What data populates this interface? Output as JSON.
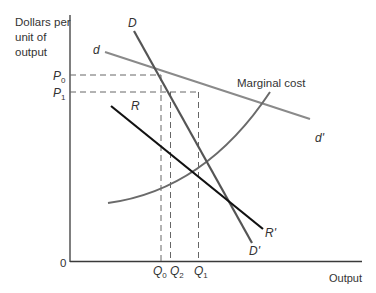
{
  "axes": {
    "y_label_lines": [
      "Dollars per",
      "unit of",
      "output"
    ],
    "x_label": "Output",
    "origin": "0"
  },
  "price_ticks": [
    {
      "name": "P",
      "sub": "0"
    },
    {
      "name": "P",
      "sub": "1"
    }
  ],
  "quantity_ticks": [
    {
      "name": "Q",
      "sub": "0"
    },
    {
      "name": "Q",
      "sub": "2"
    },
    {
      "name": "Q",
      "sub": "1"
    }
  ],
  "curves": {
    "D": {
      "start": "D",
      "end": "D'"
    },
    "d": {
      "start": "d",
      "end": "d'"
    },
    "R": {
      "start": "R",
      "end": "R'"
    },
    "mc": {
      "label": "Marginal cost"
    }
  },
  "colors": {
    "axis": "#3a3a3a",
    "D": "#555555",
    "d": "#8a8a8a",
    "R": "#111111",
    "mc": "#6a6a6a",
    "dashed": "#666666"
  }
}
